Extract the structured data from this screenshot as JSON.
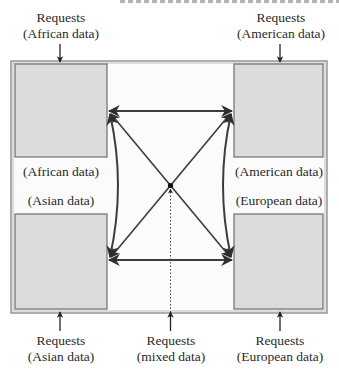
{
  "diagram": {
    "type": "replicated-database-network",
    "colors": {
      "frame": "#7a7a7a",
      "box_fill": "#dcdcdc",
      "box_border": "#6e6e6e",
      "arrow": "#3c3c3c",
      "text": "#2a2a2a"
    },
    "nodes": [
      {
        "id": "africa",
        "data_label": "(African data)"
      },
      {
        "id": "america",
        "data_label": "(American data)"
      },
      {
        "id": "asia",
        "data_label": "(Asian data)"
      },
      {
        "id": "europe",
        "data_label": "(European data)"
      }
    ],
    "request_labels": {
      "africa": {
        "line1": "Requests",
        "line2": "(African data)"
      },
      "america": {
        "line1": "Requests",
        "line2": "(American data)"
      },
      "asia": {
        "line1": "Requests",
        "line2": "(Asian data)"
      },
      "mixed": {
        "line1": "Requests",
        "line2": "(mixed data)"
      },
      "europe": {
        "line1": "Requests",
        "line2": "(European data)"
      }
    },
    "edges": [
      {
        "from": "africa",
        "to": "america",
        "style": "bidirectional-straight"
      },
      {
        "from": "asia",
        "to": "europe",
        "style": "bidirectional-straight"
      },
      {
        "from": "africa",
        "to": "asia",
        "style": "bidirectional-curved"
      },
      {
        "from": "america",
        "to": "europe",
        "style": "bidirectional-curved"
      },
      {
        "from": "africa",
        "to": "europe",
        "style": "bidirectional-diagonal"
      },
      {
        "from": "america",
        "to": "asia",
        "style": "bidirectional-diagonal"
      },
      {
        "from": "mixed-requests",
        "to": "center",
        "style": "dotted"
      }
    ]
  }
}
